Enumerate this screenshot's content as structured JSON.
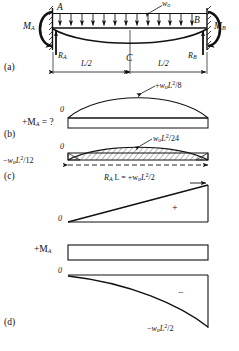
{
  "figure": {
    "type": "structural-engineering-beam-diagram",
    "panels": [
      {
        "id": "a",
        "label": "(a)",
        "caption": "loaded beam free body"
      },
      {
        "id": "b",
        "label": "(b)",
        "caption": "parabolic moment diagram"
      },
      {
        "id": "c",
        "label": "(c)",
        "caption": "net moment diagram with hatching"
      },
      {
        "id": "d",
        "label": "(d)",
        "caption": "cantilever moment diagram"
      }
    ]
  },
  "panel_a": {
    "panel_label": "(a)",
    "point_a": "A",
    "point_b": "B",
    "point_c": "C",
    "load_symbol": "w",
    "load_sub": "o",
    "moment_a": "M",
    "moment_a_sub": "A",
    "moment_b": "M",
    "moment_b_sub": "B",
    "reaction_a": "R",
    "reaction_a_sub": "A",
    "reaction_b": "R",
    "reaction_b_sub": "B",
    "span_left": "L/2",
    "span_right": "L/2"
  },
  "panel_b": {
    "panel_label": "(b)",
    "zero_label": "0",
    "left_label_prefix": "+M",
    "left_label_sub": "A",
    "left_label_suffix": " = ?",
    "peak_label_sign": "+",
    "peak_label_w": "w",
    "peak_label_w_sub": "o",
    "peak_label_L": "L",
    "peak_label_exp": "2",
    "peak_label_div": "/8",
    "peak_label_full": "+w L /8"
  },
  "panel_c": {
    "panel_label": "(c)",
    "zero_label": "0",
    "top_label_w": "w",
    "top_label_w_sub": "o",
    "top_label_L": "L",
    "top_label_exp": "2",
    "top_label_div": "/24",
    "top_label_full": "w L /24",
    "left_label_sign": "−",
    "left_label_w": "w",
    "left_label_w_sub": "o",
    "left_label_L": "L",
    "left_label_exp": "2",
    "left_label_div": "/12",
    "left_label_full": "−w L /12",
    "ra_label_R": "R",
    "ra_label_sub": "A",
    "ra_label_rest": " L = +w",
    "ra_label_w_sub": "o",
    "ra_label_L": "L",
    "ra_label_exp": "2",
    "ra_label_div": "/2",
    "ra_label_full": "R L = +w L /2",
    "plus_sign": "+"
  },
  "panel_d": {
    "panel_label": "(d)",
    "zero_label": "0",
    "top_label_sign": "+M",
    "top_label_sub": "A",
    "minus_sign": "−",
    "bottom_label_sign": "−",
    "bottom_label_w": "w",
    "bottom_label_w_sub": "o",
    "bottom_label_L": "L",
    "bottom_label_exp": "2",
    "bottom_label_div": "/2",
    "bottom_label_full": "−w L /2"
  },
  "colors": {
    "ink": "#111111",
    "background": "#ffffff",
    "hatch": "#333333"
  }
}
